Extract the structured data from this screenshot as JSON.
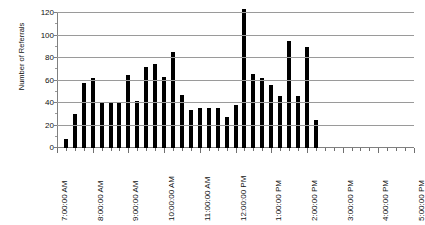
{
  "chart_data": {
    "type": "bar",
    "title": "",
    "xlabel": "",
    "ylabel": "Number of Referrals",
    "ylim": [
      0,
      120
    ],
    "yticks": [
      0,
      20,
      40,
      60,
      80,
      100,
      120
    ],
    "grid": true,
    "legend": "none",
    "xtick_labels": [
      "7:00:00 AM",
      "8:00:00 AM",
      "9:00:00 AM",
      "10:00:00 AM",
      "11:00:00 AM",
      "12:00:00 PM",
      "1:00:00 PM",
      "2:00:00 PM",
      "3:00:00 PM",
      "4:00:00 PM",
      "5:00:00 PM"
    ],
    "xtick_hours": [
      7,
      8,
      9,
      10,
      11,
      12,
      13,
      14,
      15,
      16,
      17
    ],
    "x_axis_start": "7:00:00 AM",
    "x_axis_end": "5:00:00 PM",
    "bin_minutes": 15,
    "bar_color": "#000000",
    "categories": [
      "7:15 AM",
      "7:30 AM",
      "7:45 AM",
      "8:00 AM",
      "8:15 AM",
      "8:30 AM",
      "8:45 AM",
      "9:00 AM",
      "9:15 AM",
      "9:30 AM",
      "9:45 AM",
      "10:00 AM",
      "10:15 AM",
      "10:30 AM",
      "10:45 AM",
      "11:00 AM",
      "11:15 AM",
      "11:30 AM",
      "11:45 AM",
      "12:00 PM",
      "12:15 PM",
      "12:30 PM",
      "12:45 PM",
      "1:00 PM",
      "1:15 PM",
      "1:30 PM",
      "1:45 PM",
      "2:00 PM"
    ],
    "values": [
      8,
      30,
      58,
      62,
      40,
      40,
      40,
      65,
      42,
      72,
      75,
      63,
      85,
      47,
      34,
      36,
      36,
      36,
      28,
      38,
      124,
      66,
      62,
      56,
      46,
      95,
      46,
      90
    ],
    "last_bar": {
      "label": "2:15 PM",
      "value": 25
    },
    "max_value": 124
  }
}
